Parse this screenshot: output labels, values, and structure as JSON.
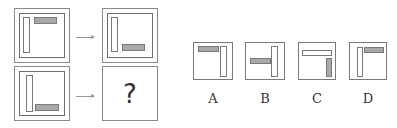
{
  "puzzle": {
    "question_mark": "?",
    "panels": [
      {
        "id": "top-left",
        "description": "white vertical bar at left, gray horizontal bar at top-right"
      },
      {
        "id": "top-right",
        "description": "white vertical bar at left, gray horizontal bar at bottom-right"
      },
      {
        "id": "bottom-left",
        "description": "white vertical bar at left, gray horizontal bar at bottom-right (L shape)"
      },
      {
        "id": "bottom-right",
        "description": "unknown answer"
      }
    ]
  },
  "options": [
    {
      "label": "A",
      "description": "gray horizontal bar top-left, white vertical bar right"
    },
    {
      "label": "B",
      "description": "gray horizontal bar middle-left, white vertical bar right (T shape)"
    },
    {
      "label": "C",
      "description": "white horizontal bar top, gray vertical bar bottom-right"
    },
    {
      "label": "D",
      "description": "white vertical bar left, gray horizontal bar top-right"
    }
  ],
  "colors": {
    "gray_fill": "#a8a8a8",
    "border": "#7a7a7a",
    "background": "#ffffff"
  }
}
